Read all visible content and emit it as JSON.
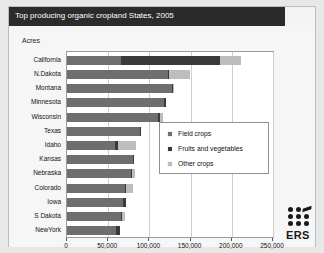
{
  "title": "Top producing organic cropland States, 2005",
  "axis_label": "Acres",
  "logo": {
    "text": "ERS",
    "name": "ers-logo"
  },
  "legend": {
    "items": [
      {
        "label": "Field crops",
        "key": "field",
        "color": "#6e6e6e"
      },
      {
        "label": "Fruits and vegetables",
        "key": "fruit",
        "color": "#3a3a3a"
      },
      {
        "label": "Other crops",
        "key": "other",
        "color": "#bdbdbd"
      }
    ]
  },
  "chart_data": {
    "type": "bar",
    "orientation": "horizontal",
    "stacked": true,
    "title": "Top producing organic cropland States, 2005",
    "xlabel": "Acres",
    "ylabel": "",
    "xlim": [
      0,
      250000
    ],
    "xticks": [
      0,
      50000,
      100000,
      150000,
      200000,
      250000
    ],
    "xticklabels": [
      "0",
      "50,000",
      "100,000",
      "150,000",
      "200,000",
      "250,000"
    ],
    "grid": true,
    "legend_position": "center-right",
    "categories": [
      "California",
      "N.Dakota",
      "Montana",
      "Minnesota",
      "Wisconsin",
      "Texas",
      "Idaho",
      "Kansas",
      "Nebraska",
      "Colorado",
      "Iowa",
      "S Dakota",
      "NewYork"
    ],
    "series": [
      {
        "name": "Field crops",
        "color": "#6e6e6e",
        "values": [
          66000,
          122000,
          128000,
          118000,
          110000,
          89000,
          58000,
          80000,
          78000,
          70000,
          68000,
          66000,
          60000
        ]
      },
      {
        "name": "Fruits and vegetables",
        "color": "#3a3a3a",
        "values": [
          120000,
          2000,
          1000,
          2000,
          3000,
          1000,
          4000,
          1000,
          1000,
          2000,
          3000,
          1000,
          4000
        ]
      },
      {
        "name": "Other crops",
        "color": "#bdbdbd",
        "values": [
          25000,
          25000,
          1000,
          0,
          4000,
          0,
          22000,
          0,
          3000,
          8000,
          0,
          3000,
          0
        ]
      }
    ],
    "totals": [
      211000,
      149000,
      130000,
      120000,
      117000,
      90000,
      84000,
      81000,
      82000,
      80000,
      71000,
      70000,
      64000
    ]
  }
}
